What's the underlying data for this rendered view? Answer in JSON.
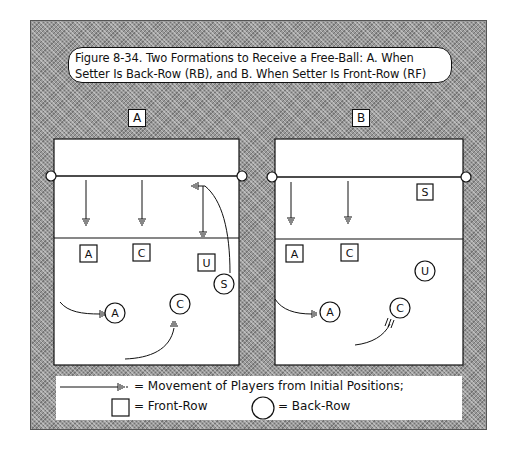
{
  "figure": {
    "title_line1": "Figure 8-34. Two Formations to Receive a Free-Ball: A. When",
    "title_line2": "Setter Is Back-Row (RB), and B. When Setter Is Front-Row (RF)"
  },
  "panels": [
    {
      "label": "A",
      "description": "Setter is Back-Row (RB)",
      "front_row_players": [
        {
          "label": "A",
          "x": 88,
          "y": 254
        },
        {
          "label": "C",
          "x": 142,
          "y": 253
        },
        {
          "label": "U",
          "x": 207,
          "y": 263
        }
      ],
      "back_row_players": [
        {
          "label": "A",
          "x": 115,
          "y": 313
        },
        {
          "label": "C",
          "x": 180,
          "y": 304
        },
        {
          "label": "S",
          "x": 224,
          "y": 284
        }
      ]
    },
    {
      "label": "B",
      "description": "Setter is Front-Row (RF)",
      "front_row_players": [
        {
          "label": "A",
          "x": 294,
          "y": 254
        },
        {
          "label": "C",
          "x": 349,
          "y": 253
        },
        {
          "label": "S",
          "x": 425,
          "y": 192
        }
      ],
      "back_row_players": [
        {
          "label": "U",
          "x": 425,
          "y": 271
        },
        {
          "label": "A",
          "x": 330,
          "y": 312
        },
        {
          "label": "C",
          "x": 400,
          "y": 308
        }
      ]
    }
  ],
  "legend": {
    "movement": "= Movement of Players from Initial Positions;",
    "front_row": "= Front-Row",
    "back_row": "= Back-Row"
  },
  "colors": {
    "ink": "#111111",
    "court": "#ffffff",
    "background_pattern": "#9a9a9a"
  }
}
